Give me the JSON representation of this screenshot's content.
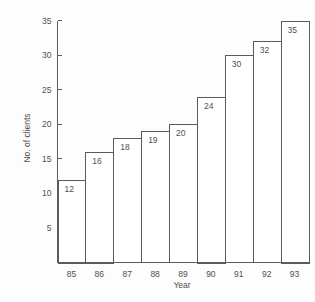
{
  "chart_data": {
    "type": "bar",
    "title": "",
    "xlabel": "Year",
    "ylabel": "No. of clients",
    "categories": [
      "85",
      "86",
      "87",
      "88",
      "89",
      "90",
      "91",
      "92",
      "93"
    ],
    "values": [
      12,
      16,
      18,
      19,
      20,
      24,
      30,
      32,
      35
    ],
    "data_labels": [
      "12",
      "16",
      "18",
      "19",
      "20",
      "24",
      "30",
      "32",
      "35"
    ],
    "ylim": [
      0,
      35
    ],
    "yticks": [
      5,
      10,
      15,
      20,
      25,
      30,
      35
    ],
    "ytick_labels": [
      "5",
      "10",
      "15",
      "20",
      "25",
      "30",
      "35"
    ],
    "xtick_labels": [
      "85",
      "86",
      "87",
      "88",
      "89",
      "90",
      "91",
      "92",
      "93"
    ],
    "grid": false,
    "legend": null,
    "legend_position": "none",
    "bar_fill_color": "#ffffff",
    "bar_edge_color": "#5a5a5a",
    "axis_color": "#5d5d5d",
    "text_color": "#4f4f4f",
    "background_color": "#fdfdfd"
  }
}
